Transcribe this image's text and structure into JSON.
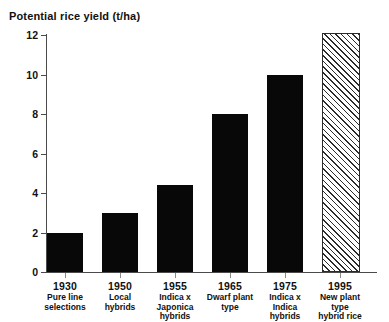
{
  "chart_data": {
    "type": "bar",
    "title": "Potential rice yield (t/ha)",
    "xlabel": "",
    "ylabel": "Potential rice yield (t/ha)",
    "ylim": [
      0,
      12
    ],
    "yticks": [
      0,
      2,
      4,
      6,
      8,
      10,
      12
    ],
    "grid": false,
    "legend": "none",
    "categories": [
      "1930",
      "1950",
      "1955",
      "1965",
      "1975",
      "1995"
    ],
    "category_descriptions": [
      "Pure line\nselections",
      "Local hybrids",
      "Indica x\nJaponica\nhybrids",
      "Dwarf plant\ntype",
      "Indica x\nIndica\nhybrids",
      "New plant\ntype\n hybrid rice"
    ],
    "values": [
      2.0,
      3.0,
      4.4,
      8.0,
      10.0,
      12.0
    ],
    "bar_styles": [
      "solid",
      "solid",
      "solid",
      "solid",
      "solid",
      "hatched"
    ],
    "colors": {
      "bar_fill": "#080808",
      "hatch_line": "#2b2b2b",
      "hatch_background": "#ffffff",
      "axis": "#4a4a4a",
      "text": "#111111",
      "background": "#ffffff"
    }
  },
  "yticks_text": [
    "12",
    "10",
    "8",
    "6",
    "4",
    "2",
    "0"
  ]
}
